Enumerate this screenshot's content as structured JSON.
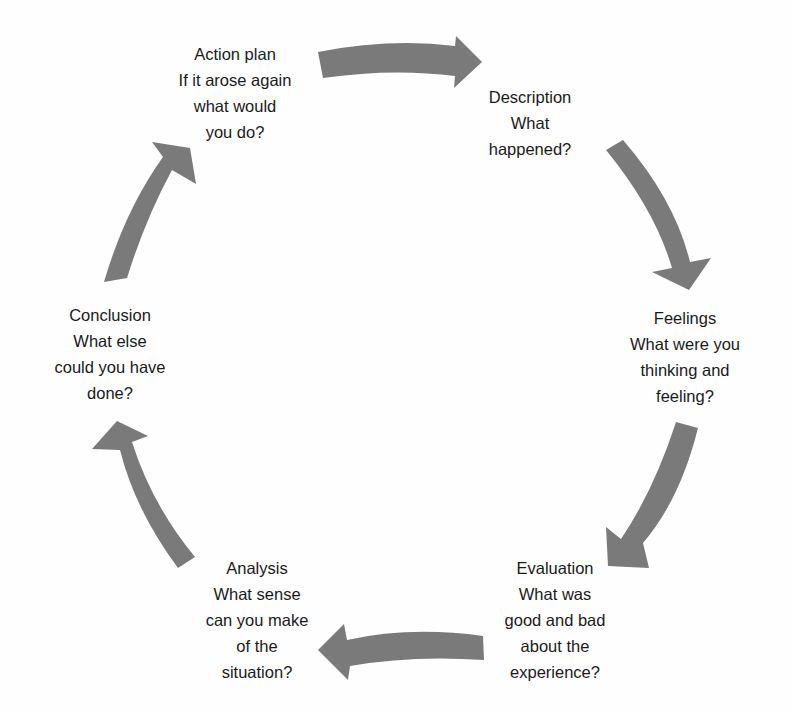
{
  "diagram": {
    "type": "cycle",
    "arrow_color": "#7a7a7a",
    "text_color": "#1a1a1a",
    "stages": [
      {
        "title": "Description",
        "lines": [
          "Description",
          "What",
          "happened?"
        ]
      },
      {
        "title": "Feelings",
        "lines": [
          "Feelings",
          "What were you",
          "thinking and",
          "feeling?"
        ]
      },
      {
        "title": "Evaluation",
        "lines": [
          "Evaluation",
          "What was",
          "good and bad",
          "about the",
          "experience?"
        ]
      },
      {
        "title": "Analysis",
        "lines": [
          "Analysis",
          "What sense",
          "can you make",
          "of the",
          "situation?"
        ]
      },
      {
        "title": "Conclusion",
        "lines": [
          "Conclusion",
          "What else",
          "could you have",
          "done?"
        ]
      },
      {
        "title": "Action plan",
        "lines": [
          "Action plan",
          "If it arose again",
          "what would",
          "you do?"
        ]
      }
    ],
    "edges": [
      {
        "from": "Action plan",
        "to": "Description"
      },
      {
        "from": "Description",
        "to": "Feelings"
      },
      {
        "from": "Feelings",
        "to": "Evaluation"
      },
      {
        "from": "Evaluation",
        "to": "Analysis"
      },
      {
        "from": "Analysis",
        "to": "Conclusion"
      },
      {
        "from": "Conclusion",
        "to": "Action plan"
      }
    ]
  }
}
